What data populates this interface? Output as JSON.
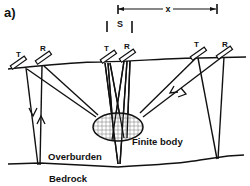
{
  "figure": {
    "panel_label": "a)",
    "spacing_label": "S",
    "offset_label": "x",
    "transmitter_label": "T",
    "receiver_label": "R",
    "body_label": "Finite body",
    "overburden_label": "Overburden",
    "bedrock_label": "Bedrock"
  },
  "colors": {
    "line": "#111111",
    "background": "#ffffff",
    "hatch": "#888888"
  },
  "antenna_pairs": [
    {
      "id": "left",
      "T": "T",
      "R": "R"
    },
    {
      "id": "center",
      "T": "T",
      "R": "R"
    },
    {
      "id": "right",
      "T": "T",
      "R": "R"
    }
  ]
}
